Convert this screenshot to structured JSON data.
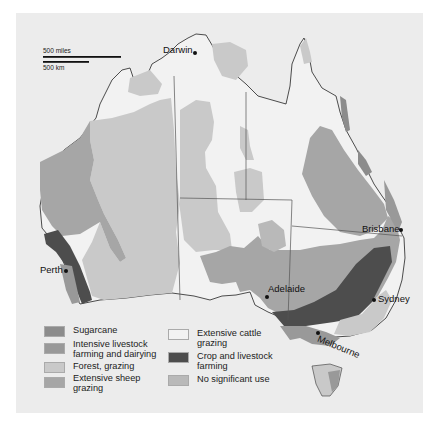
{
  "scale": {
    "miles_label": "500 miles",
    "km_label": "500 km"
  },
  "cities": {
    "darwin": "Darwin",
    "perth": "Perth",
    "adelaide": "Adelaide",
    "brisbane": "Brisbane",
    "sydney": "Sydney",
    "melbourne": "Melbourne"
  },
  "colors": {
    "background": "#ececec",
    "cattle": "#f2f2f2",
    "forest": "#c9c9c9",
    "sheep": "#a6a6a6",
    "intensive": "#999999",
    "sugarcane": "#8c8c8c",
    "crop": "#4d4d4d",
    "none": "#b9b9b9"
  },
  "legend": [
    {
      "key": "sugarcane",
      "label": "Sugarcane"
    },
    {
      "key": "intensive",
      "label": "Intensive livestock farming and dairying"
    },
    {
      "key": "forest",
      "label": "Forest, grazing"
    },
    {
      "key": "sheep",
      "label": "Extensive sheep grazing"
    },
    {
      "key": "cattle",
      "label": "Extensive cattle grazing"
    },
    {
      "key": "crop",
      "label": "Crop and livestock farming"
    },
    {
      "key": "none",
      "label": "No significant use"
    }
  ]
}
